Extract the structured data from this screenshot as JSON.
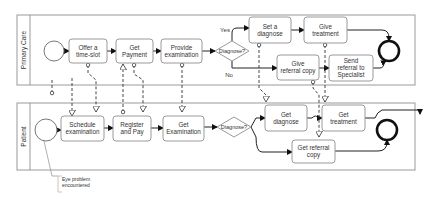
{
  "pools": [
    {
      "id": "primary-care",
      "label": "Primary Care",
      "x": 17,
      "y": 15,
      "w": 398,
      "h": 70,
      "label_w": 13
    },
    {
      "id": "patient",
      "label": "Patient",
      "x": 17,
      "y": 103,
      "w": 398,
      "h": 67,
      "label_w": 13
    }
  ],
  "tasks": [
    {
      "id": "offer-time-slot",
      "lines": [
        "Offer a",
        "time-slot"
      ],
      "x": 69,
      "y": 39,
      "w": 38,
      "h": 24
    },
    {
      "id": "get-payment",
      "lines": [
        "Get",
        "Payment"
      ],
      "x": 116,
      "y": 39,
      "w": 37,
      "h": 24
    },
    {
      "id": "provide-examination",
      "lines": [
        "Provide",
        "examination"
      ],
      "x": 161,
      "y": 39,
      "w": 41,
      "h": 24
    },
    {
      "id": "set-a-diagnose",
      "lines": [
        "Set a",
        "diagnose"
      ],
      "x": 249,
      "y": 17,
      "w": 42,
      "h": 26
    },
    {
      "id": "give-treatment",
      "lines": [
        "Give",
        "treatment"
      ],
      "x": 304,
      "y": 17,
      "w": 43,
      "h": 26
    },
    {
      "id": "give-referral-copy",
      "lines": [
        "Give",
        "referral copy"
      ],
      "x": 277,
      "y": 55,
      "w": 42,
      "h": 25
    },
    {
      "id": "send-referral-to-specialist",
      "lines": [
        "Send",
        "referral to",
        "Specialist"
      ],
      "x": 329,
      "y": 55,
      "w": 44,
      "h": 26
    },
    {
      "id": "schedule-examination",
      "lines": [
        "Schedule",
        "examination"
      ],
      "x": 61,
      "y": 116,
      "w": 43,
      "h": 25
    },
    {
      "id": "register-and-pay",
      "lines": [
        "Register",
        "and Pay"
      ],
      "x": 113,
      "y": 116,
      "w": 38,
      "h": 25
    },
    {
      "id": "get-examination",
      "lines": [
        "Get",
        "Examination"
      ],
      "x": 163,
      "y": 116,
      "w": 41,
      "h": 25
    },
    {
      "id": "get-diagnose",
      "lines": [
        "Get",
        "diagnose"
      ],
      "x": 265,
      "y": 105,
      "w": 42,
      "h": 26
    },
    {
      "id": "get-treatment",
      "lines": [
        "Get",
        "treatment"
      ],
      "x": 322,
      "y": 105,
      "w": 43,
      "h": 26
    },
    {
      "id": "get-referral-copy",
      "lines": [
        "Get referral",
        "copy"
      ],
      "x": 292,
      "y": 140,
      "w": 43,
      "h": 23
    }
  ],
  "gateways": [
    {
      "id": "gateway-diagnose-top",
      "label": "Diagnose?",
      "cx": 232,
      "cy": 51,
      "rx": 17,
      "ry": 10
    },
    {
      "id": "gateway-diagnose-bottom",
      "label": "Diagnose?",
      "cx": 234,
      "cy": 127,
      "rx": 17,
      "ry": 10
    }
  ],
  "branch_labels": [
    {
      "id": "label-yes",
      "text": "Yes",
      "x": 225,
      "y": 32
    },
    {
      "id": "label-no",
      "text": "No",
      "x": 229,
      "y": 77
    }
  ],
  "start_events": [
    {
      "id": "start-primary-care",
      "cx": 54,
      "cy": 51,
      "r": 10
    },
    {
      "id": "start-patient",
      "cx": 46,
      "cy": 130,
      "r": 11
    }
  ],
  "end_events": [
    {
      "id": "end-primary-care",
      "cx": 389,
      "cy": 51,
      "r": 10
    },
    {
      "id": "end-patient",
      "cx": 387,
      "cy": 130,
      "r": 10
    }
  ],
  "annotation": {
    "lines": [
      "Eye problem",
      "encountered"
    ],
    "x": 60,
    "y": 181
  },
  "sequence_flows": [
    "M64,51 L69,51",
    "M107,51 L116,51",
    "M153,51 L161,51",
    "M202,51 L215,51",
    "M232,41 L232,33 Q232,28 237,28 L249,28",
    "M232,61 L232,68 Q232,68 240,68 L277,68",
    "M291,30 L304,30",
    "M347,30 L382,30 Q389,30 389,38 L389,41",
    "M319,68 L329,68",
    "M373,68 L380,68 Q384,68 384,62 L386,61",
    "M57,130 L61,130",
    "M104,128 L113,128",
    "M151,128 L163,128",
    "M204,127 L217,127",
    "M251,127 L256,118 L265,118",
    "M251,127 L256,137 Q256,152 262,152 L292,152",
    "M307,118 L312,118 Q316,114 318,118 L322,118",
    "M365,118 L375,118 Q377,112 382,110 L420,110 L420,114",
    "M335,151 L378,151 Q387,151 387,142 L387,140"
  ],
  "message_flows": [
    "M52,93 L52,79 M72,78 L72,93 L72,116",
    "M88,65 L88,73 L96,80 L96,112",
    "M123,112 L123,64",
    "M134,65 L134,74 L143,80 L143,112",
    "M182,65 L182,112",
    "M259,45 L259,88 L266,95 L266,102",
    "M313,82 L313,88 L319,95 L319,137",
    "M325,45 L325,102"
  ],
  "colors": {
    "border": "#9a9a9a",
    "text": "#333333",
    "flow": "#222222",
    "end_event": "#111111",
    "annotation_text": "#a0a0a0"
  }
}
